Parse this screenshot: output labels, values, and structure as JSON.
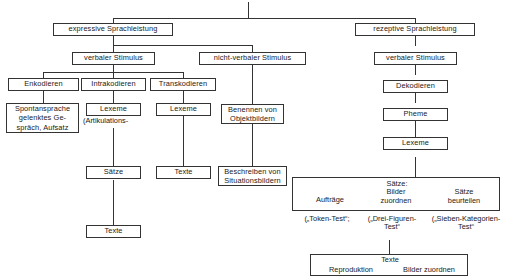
{
  "diagram": {
    "root_label": "",
    "nodes": {
      "expressive": "expressive Sprachleistung",
      "rezeptive": "rezeptive Sprachleistung",
      "verbaler_stimulus_links": "verbaler Stimulus",
      "nicht_verbaler_stimulus": "nicht-verbaler Stimulus",
      "verbaler_stimulus_rechts": "verbaler Stimulus",
      "enkodieren": "Enkodieren",
      "intrakodieren": "Intrakodieren",
      "transkodieren": "Transkodieren",
      "dekodieren": "Dekodieren",
      "pheme": "Pheme",
      "spontansprache_l1": "Spontansprache",
      "spontansprache_l2": "gelenktes Ge-",
      "spontansprache_l3": "spräch, Aufsatz",
      "lexeme_intra": "Lexeme",
      "lexeme_trans": "Lexeme",
      "lexeme_rezeptiv": "Lexeme",
      "artikulations_note": "(Artikulations-",
      "benennen_l1": "Benennen von",
      "benennen_l2": "Objektbildern",
      "beschreiben_l1": "Beschreiben von",
      "beschreiben_l2": "Situationsbildern",
      "saetze": "Sätze",
      "texte_mitte": "Texte",
      "texte_unten": "Texte"
    },
    "saetze_panel": {
      "heading": "Sätze:",
      "col1_line1": "Aufträge",
      "col2_line1": "Bilder",
      "col2_line2": "zuordnen",
      "col3_line1": "Sätze",
      "col3_line2": "beurteilen"
    },
    "test_labels": {
      "token_test": "(„Token-Test“;",
      "drei_figuren_l1": "(„Drei-Figuren-",
      "drei_figuren_l2": "Test“",
      "sieben_kategorien_l1": "(„Sieben-Kategorien-",
      "sieben_kategorien_l2": "Test“"
    },
    "texte_panel": {
      "heading": "Texte",
      "left": "Reproduktion",
      "right": "Bilder zuordnen"
    },
    "colors": {
      "stroke": "#333333",
      "text": "#1a1a1a",
      "background": "#ffffff"
    }
  }
}
